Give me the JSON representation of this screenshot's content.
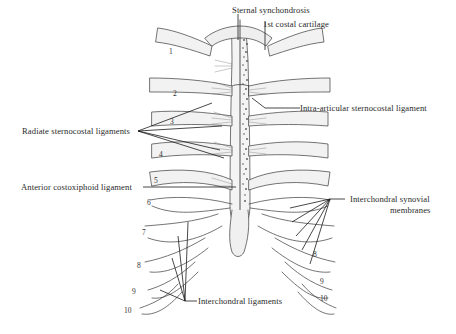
{
  "figure": {
    "type": "anatomical-illustration",
    "labels": {
      "sternal_synchondrosis": "Sternal synchondrosis",
      "first_costal_cartilage": "1st costal cartilage",
      "intra_articular": "Intra-articular sternocostal ligament",
      "radiate": "Radiate sternocostal ligaments",
      "costoxiphoid": "Anterior costoxiphoid ligament",
      "synovial_line1": "Interchondral synovial",
      "synovial_line2": "membranes",
      "interchondral": "Interchondral ligaments"
    },
    "rib_numbers_left": [
      "1",
      "2",
      "3",
      "4",
      "5",
      "6",
      "7",
      "8",
      "9",
      "10"
    ],
    "rib_numbers_right": [
      "8",
      "9",
      "10"
    ],
    "colors": {
      "ink": "#2a2a2a",
      "shade": "#8a8a8a",
      "background": "#ffffff"
    }
  }
}
